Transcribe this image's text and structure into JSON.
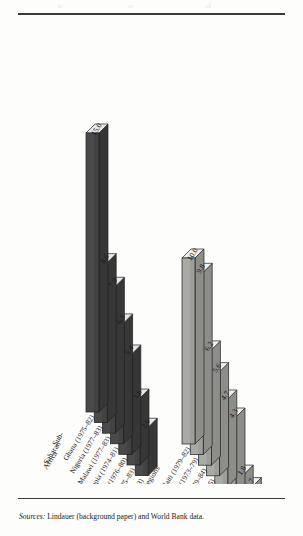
{
  "figure": {
    "top_fragments": [
      "h",
      "sc",
      "of"
    ],
    "source_prefix": "Sources:",
    "source_text": " Lindauer (background paper) and World Bank data."
  },
  "style": {
    "bar_dark_face": "#4a4a4a",
    "bar_dark_side": "#373737",
    "bar_dark_top": "#e8e8e6",
    "bar_light_face": "#a9a9a5",
    "bar_light_side": "#8d8d89",
    "bar_light_top": "#efefec",
    "outline": "#1f1f1f",
    "text": "#1a1a1a",
    "page_bg": "#fdfdfc"
  },
  "chart_data": {
    "type": "bar",
    "title": "",
    "subtitle": "",
    "xlabel": "",
    "ylabel": "",
    "grid": false,
    "legend_position": "none",
    "projection": "3d-isometric",
    "value_label_format": "one-decimal",
    "ylim": [
      -6.2,
      15.0
    ],
    "groups": [
      {
        "name": "Sub-Saharan Africa",
        "label_lines": [
          "Sub-",
          "Saharan",
          "Africa"
        ],
        "shade": "dark",
        "categories": [
          "Ghana (1975–82)",
          "Nigeria (1977–83)",
          "Malawi (1977–83)",
          "Ethiopia (1974–81)",
          "Senegal (1976–80)",
          "Sudan (1975–83)",
          "Zambia (1978–83)"
        ],
        "values": [
          15.0,
          8.6,
          7.9,
          6.5,
          5.4,
          3.6,
          2.6
        ],
        "value_labels": [
          "15.0",
          "8.6",
          "7.9",
          "6.5",
          "5.4",
          "3.6",
          "2.6"
        ]
      },
      {
        "name": "Other regions",
        "label_lines": [
          "Other regions"
        ],
        "shade": "light",
        "categories": [
          "Haiti (1979–82)",
          "Costa Rica (1973–79)",
          "Thailand (1979–84)",
          "Bolivia (1975–85)",
          "Malaysia (1975–85)",
          "Peru (1970–78)",
          "Singapore (1975–83)",
          "Sri Lanka (1975–85)",
          "Guyana (1980–86)"
        ],
        "values": [
          10.0,
          9.8,
          6.2,
          5.6,
          4.7,
          4.3,
          1.8,
          1.7,
          -6.2
        ],
        "value_labels": [
          "10.0",
          "9.8",
          "6.2",
          "5.6",
          "4.7",
          "4.3",
          "1.8",
          "1.7",
          "–6.2"
        ]
      }
    ]
  }
}
